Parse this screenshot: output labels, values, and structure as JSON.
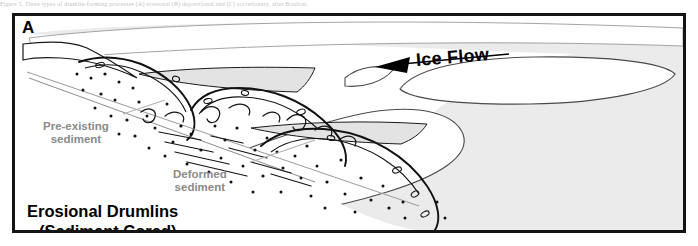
{
  "figure": {
    "caption_strip": "Figure 5. Three types of drumlin-forming processes (A) erosional (B) depositional and (C) accretionary, after Boulton.",
    "panel_letter": "A",
    "title_line1": "Erosional Drumlins",
    "title_line2": "(Sediment Cored)",
    "border_color": "#141414",
    "background_color": "#ffffff"
  },
  "diagram": {
    "ice_flow_label": "Ice Flow",
    "ice_flow_direction": "left",
    "arrow_icon": "left-arrow-icon",
    "labels": [
      {
        "id": "pre-existing",
        "line1": "Pre-existing",
        "line2": "sediment",
        "color": "#8a8a8a"
      },
      {
        "id": "deformed",
        "line1": "Deformed",
        "line2": "sediment",
        "color": "#8a8a8a"
      }
    ],
    "colors": {
      "plan_view_ground": "#ebebeb",
      "drumlin_fill": "#ffffff",
      "ice_band": "#e3e3e3",
      "outline": "#1a1a1a",
      "leader_line": "#b4b4b4",
      "clast": "#111111"
    },
    "features": {
      "drumlin_count": 4,
      "clast_symbol": "dot",
      "deformation_symbol": "folded-laminae"
    }
  }
}
